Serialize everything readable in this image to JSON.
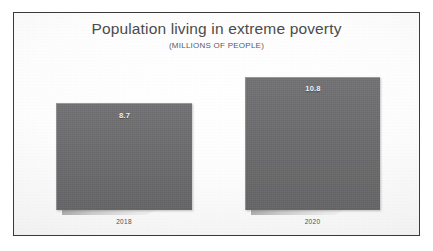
{
  "chart_data": {
    "type": "bar",
    "title": "Population living in extreme poverty",
    "subtitle": "(MILLIONS OF PEOPLE)",
    "xlabel": "",
    "ylabel": "Millions of people",
    "categories": [
      "2018",
      "2020"
    ],
    "values": [
      8.7,
      10.8
    ],
    "value_labels": [
      "8.7",
      "10.8"
    ],
    "ylim": [
      0,
      10.8
    ],
    "grid": false,
    "legend": "none",
    "series": [
      {
        "name": "Population living in extreme poverty",
        "values": [
          8.7,
          10.8
        ]
      }
    ]
  },
  "slide": {
    "title": "Population living in extreme poverty",
    "subtitle": "(MILLIONS OF PEOPLE)",
    "bars": [
      {
        "category": "2018",
        "value_label": "8.7"
      },
      {
        "category": "2020",
        "value_label": "10.8"
      }
    ]
  },
  "colors": {
    "bar_fill": "#6b6b6d",
    "title_text": "#4b4b4d",
    "subtitle_text": "#5a5a5c",
    "category_text": "#4e4e50",
    "value_text": "#f2f2f2",
    "frame_border": "#3a3a3c",
    "background": "#fbfbfb"
  }
}
